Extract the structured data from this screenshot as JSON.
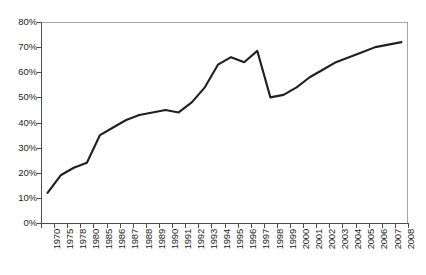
{
  "chart_data": {
    "type": "line",
    "title": "",
    "subtitle": "",
    "xlabel": "",
    "ylabel": "",
    "categories": [
      "1970",
      "1975",
      "1978",
      "1980",
      "1985",
      "1986",
      "1987",
      "1988",
      "1989",
      "1990",
      "1991",
      "1992",
      "1993",
      "1994",
      "1995",
      "1996",
      "1997",
      "1998",
      "1999",
      "2000",
      "2001",
      "2002",
      "2003",
      "2004",
      "2005",
      "2006",
      "2007",
      "2008"
    ],
    "values": [
      12,
      19,
      22,
      24,
      35,
      38,
      41,
      43,
      44,
      45,
      44,
      48,
      54,
      63,
      66,
      64,
      68.5,
      50,
      51,
      54,
      58,
      61,
      64,
      66,
      68,
      70,
      71,
      72
    ],
    "series": [
      {
        "name": "series-1",
        "values": [
          12,
          19,
          22,
          24,
          35,
          38,
          41,
          43,
          44,
          45,
          44,
          48,
          54,
          63,
          66,
          64,
          68.5,
          50,
          51,
          54,
          58,
          61,
          64,
          66,
          68,
          70,
          71,
          72
        ],
        "color": "#231f20"
      }
    ],
    "ylim": [
      0,
      80
    ],
    "ytick_values": [
      0,
      10,
      20,
      30,
      40,
      50,
      60,
      70,
      80
    ],
    "ytick_labels": [
      "0%",
      "10%",
      "20%",
      "30%",
      "40%",
      "50%",
      "60%",
      "70%",
      "80%"
    ],
    "grid": false,
    "legend": null,
    "legend_position": "none",
    "annotations": []
  },
  "colors": {
    "line": "#231f20",
    "axis": "#4d4d4d",
    "frame": "#a6a6a6",
    "background": "#ffffff",
    "text": "#231f20"
  }
}
